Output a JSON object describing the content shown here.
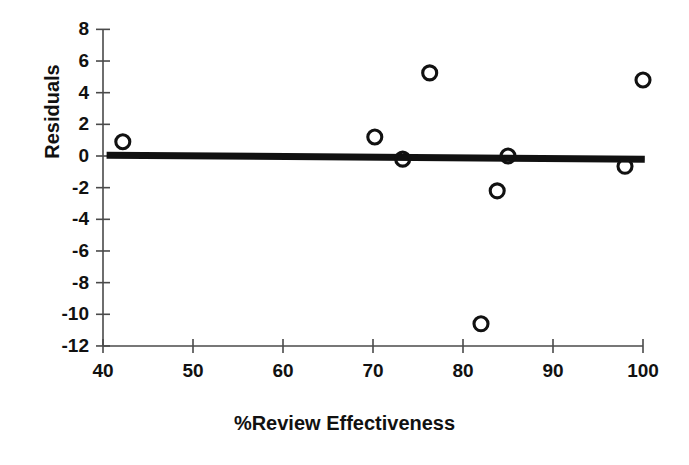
{
  "chart_data": {
    "type": "scatter",
    "title": "",
    "xlabel": "%Review Effectiveness",
    "ylabel": "Residuals",
    "xlim": [
      40,
      100
    ],
    "ylim": [
      -12,
      8
    ],
    "xticks": [
      40,
      50,
      60,
      70,
      80,
      90,
      100
    ],
    "xtick_labels": [
      "40",
      "50",
      "60",
      "70",
      "80",
      "90",
      "100"
    ],
    "yticks": [
      8,
      6,
      4,
      2,
      0,
      -2,
      -4,
      -6,
      -8,
      -10,
      -12
    ],
    "ytick_labels": [
      "8",
      "6",
      "4",
      "2",
      "0",
      "-2",
      "-4",
      "-6",
      "-8",
      "-10",
      "-12"
    ],
    "grid": false,
    "legend": "none",
    "marker_style": "open-circle",
    "marker_color": "#111111",
    "points": [
      {
        "x": 42.2,
        "y": 0.9
      },
      {
        "x": 70.2,
        "y": 1.2
      },
      {
        "x": 73.3,
        "y": -0.2
      },
      {
        "x": 76.3,
        "y": 5.25
      },
      {
        "x": 82.0,
        "y": -10.6
      },
      {
        "x": 83.8,
        "y": -2.2
      },
      {
        "x": 85.0,
        "y": 0.0
      },
      {
        "x": 98.0,
        "y": -0.65
      },
      {
        "x": 100.0,
        "y": 4.8
      }
    ],
    "series": [
      {
        "name": "Residuals",
        "x": [
          42.2,
          70.2,
          73.3,
          76.3,
          82.0,
          83.8,
          85.0,
          98.0,
          100.0
        ],
        "values": [
          0.9,
          1.2,
          -0.2,
          5.25,
          -10.6,
          -2.2,
          0.0,
          -0.65,
          4.8
        ]
      },
      {
        "name": "Reference line",
        "type": "line",
        "color": "#111111",
        "x": [
          40.4,
          100.2
        ],
        "values": [
          0.05,
          -0.2
        ]
      }
    ],
    "reference_line": {
      "x_start": 40.4,
      "y_start": 0.05,
      "x_end": 100.2,
      "y_end": -0.2,
      "color": "#111111",
      "width_px": 7
    }
  }
}
